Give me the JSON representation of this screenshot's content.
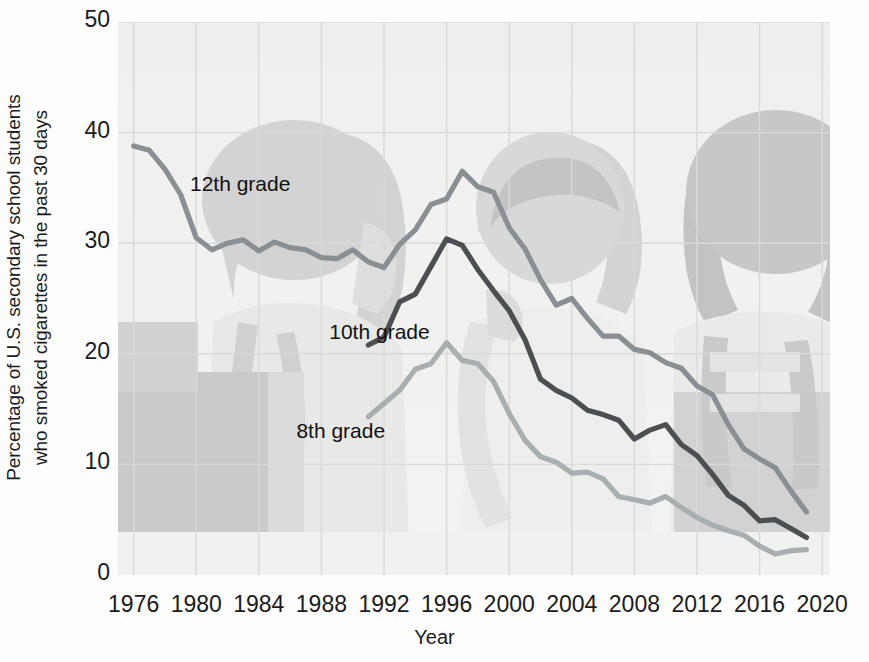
{
  "chart_data": {
    "type": "line",
    "title": "",
    "xlabel": "Year",
    "ylabel": "Percentage of U.S. secondary school students who smoked cigarettes in the past 30 days",
    "ylabel_line1": "Percentage of U.S. secondary school students",
    "ylabel_line2": "who smoked cigarettes in the past 30 days",
    "xlim": [
      1975,
      2020.5
    ],
    "ylim": [
      0,
      50
    ],
    "yticks": [
      0,
      10,
      20,
      30,
      40,
      50
    ],
    "xticks": [
      1976,
      1980,
      1984,
      1988,
      1992,
      1996,
      2000,
      2004,
      2008,
      2012,
      2016,
      2020
    ],
    "grid": true,
    "legend_position": "inline-annotations",
    "colors": {
      "grade12": "#8a8f93",
      "grade10": "#4b4f52",
      "grade8": "#a9aeb1",
      "grid": "#d9d9d6",
      "plot_background": "#f1f1f0",
      "text": "#1b1b1b"
    },
    "series": [
      {
        "name": "12th grade",
        "color": "#8a8f93",
        "label_x": 1979.6,
        "label_y": 35.2,
        "x": [
          1976,
          1977,
          1978,
          1979,
          1980,
          1981,
          1982,
          1983,
          1984,
          1985,
          1986,
          1987,
          1988,
          1989,
          1990,
          1991,
          1992,
          1993,
          1994,
          1995,
          1996,
          1997,
          1998,
          1999,
          2000,
          2001,
          2002,
          2003,
          2004,
          2005,
          2006,
          2007,
          2008,
          2009,
          2010,
          2011,
          2012,
          2013,
          2014,
          2015,
          2016,
          2017,
          2018,
          2019
        ],
        "y": [
          38.8,
          38.4,
          36.7,
          34.4,
          30.5,
          29.4,
          30.0,
          30.3,
          29.3,
          30.1,
          29.6,
          29.4,
          28.7,
          28.6,
          29.4,
          28.3,
          27.8,
          29.9,
          31.2,
          33.5,
          34.0,
          36.5,
          35.1,
          34.6,
          31.4,
          29.5,
          26.7,
          24.4,
          25.0,
          23.2,
          21.6,
          21.6,
          20.4,
          20.1,
          19.2,
          18.7,
          17.1,
          16.3,
          13.6,
          11.4,
          10.5,
          9.7,
          7.6,
          5.7
        ]
      },
      {
        "name": "10th grade",
        "color": "#4b4f52",
        "label_x": 1988.5,
        "label_y": 21.8,
        "x": [
          1991,
          1992,
          1993,
          1994,
          1995,
          1996,
          1997,
          1998,
          1999,
          2000,
          2001,
          2002,
          2003,
          2004,
          2005,
          2006,
          2007,
          2008,
          2009,
          2010,
          2011,
          2012,
          2013,
          2014,
          2015,
          2016,
          2017,
          2018,
          2019
        ],
        "y": [
          20.8,
          21.5,
          24.7,
          25.4,
          27.9,
          30.4,
          29.8,
          27.6,
          25.7,
          23.9,
          21.3,
          17.7,
          16.7,
          16.0,
          14.9,
          14.5,
          14.0,
          12.3,
          13.1,
          13.6,
          11.8,
          10.8,
          9.1,
          7.2,
          6.3,
          4.9,
          5.0,
          4.2,
          3.4
        ]
      },
      {
        "name": "8th grade",
        "color": "#a9aeb1",
        "label_x": 1986.4,
        "label_y": 12.8,
        "x": [
          1991,
          1992,
          1993,
          1994,
          1995,
          1996,
          1997,
          1998,
          1999,
          2000,
          2001,
          2002,
          2003,
          2004,
          2005,
          2006,
          2007,
          2008,
          2009,
          2010,
          2011,
          2012,
          2013,
          2014,
          2015,
          2016,
          2017,
          2018,
          2019
        ],
        "y": [
          14.3,
          15.5,
          16.7,
          18.6,
          19.1,
          21.0,
          19.4,
          19.1,
          17.5,
          14.6,
          12.2,
          10.7,
          10.2,
          9.2,
          9.3,
          8.7,
          7.1,
          6.8,
          6.5,
          7.1,
          6.1,
          5.2,
          4.5,
          4.0,
          3.6,
          2.6,
          1.9,
          2.2,
          2.3
        ]
      }
    ]
  }
}
